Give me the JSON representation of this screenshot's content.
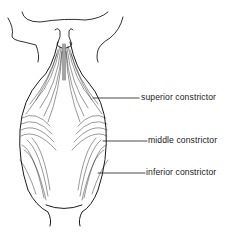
{
  "figure": {
    "colors": {
      "ink": "#1a1a1a",
      "background": "#ffffff"
    },
    "labels": [
      {
        "id": "superior",
        "text": "superior constrictor",
        "line": [
          93,
          98,
          139,
          98
        ],
        "x": 141,
        "y": 93
      },
      {
        "id": "middle",
        "text": "middle constrictor",
        "line": [
          103,
          141,
          147,
          141
        ],
        "x": 148,
        "y": 136
      },
      {
        "id": "inferior",
        "text": "inferior constrictor",
        "line": [
          98,
          173,
          145,
          173
        ],
        "x": 146,
        "y": 168
      }
    ]
  }
}
